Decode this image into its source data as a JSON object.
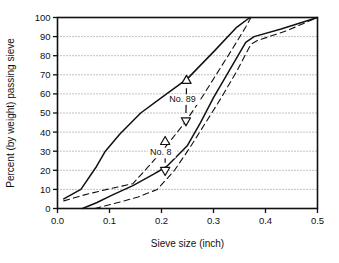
{
  "chart_data": {
    "type": "line",
    "title": "",
    "xlabel": "Sieve size (inch)",
    "ylabel": "Percent (by weight) passing sieve",
    "xlim": [
      0.0,
      0.5
    ],
    "ylim": [
      0,
      100
    ],
    "xticks": [
      "0.0",
      "0.1",
      "0.2",
      "0.3",
      "0.4",
      "0.5"
    ],
    "xtick_values": [
      0.0,
      0.1,
      0.2,
      0.3,
      0.4,
      0.5
    ],
    "yticks": [
      "0",
      "10",
      "20",
      "30",
      "40",
      "50",
      "60",
      "70",
      "80",
      "90",
      "100"
    ],
    "ytick_values": [
      0,
      10,
      20,
      30,
      40,
      50,
      60,
      70,
      80,
      90,
      100
    ],
    "grid": "horizontal-dotted",
    "legend": "none",
    "series": [
      {
        "name": "No. 89 upper limit (solid)",
        "style": "solid",
        "points": [
          [
            0.012,
            5
          ],
          [
            0.045,
            10
          ],
          [
            0.075,
            22
          ],
          [
            0.092,
            30
          ],
          [
            0.12,
            39
          ],
          [
            0.16,
            50
          ],
          [
            0.2,
            58
          ],
          [
            0.25,
            68
          ],
          [
            0.3,
            82
          ],
          [
            0.345,
            95
          ],
          [
            0.37,
            100
          ]
        ]
      },
      {
        "name": "No. 89 lower limit (solid)",
        "style": "solid",
        "points": [
          [
            0.048,
            0
          ],
          [
            0.075,
            3
          ],
          [
            0.105,
            7
          ],
          [
            0.145,
            12
          ],
          [
            0.185,
            18
          ],
          [
            0.21,
            22
          ],
          [
            0.25,
            33
          ],
          [
            0.275,
            45
          ],
          [
            0.3,
            58
          ],
          [
            0.33,
            72
          ],
          [
            0.362,
            87
          ],
          [
            0.378,
            90
          ],
          [
            0.43,
            94
          ],
          [
            0.5,
            100
          ]
        ]
      },
      {
        "name": "No. 8 upper limit (dashed)",
        "style": "dashed",
        "points": [
          [
            0.012,
            4
          ],
          [
            0.05,
            7
          ],
          [
            0.095,
            10
          ],
          [
            0.145,
            13
          ],
          [
            0.175,
            22
          ],
          [
            0.21,
            33
          ],
          [
            0.245,
            45
          ],
          [
            0.275,
            57
          ],
          [
            0.305,
            70
          ],
          [
            0.335,
            83
          ],
          [
            0.362,
            95
          ],
          [
            0.372,
            100
          ]
        ]
      },
      {
        "name": "No. 8 lower limit (dashed)",
        "style": "dashed",
        "points": [
          [
            0.072,
            0
          ],
          [
            0.115,
            3
          ],
          [
            0.155,
            6
          ],
          [
            0.192,
            10
          ],
          [
            0.225,
            20
          ],
          [
            0.255,
            32
          ],
          [
            0.285,
            45
          ],
          [
            0.315,
            58
          ],
          [
            0.345,
            72
          ],
          [
            0.372,
            86
          ],
          [
            0.385,
            88
          ],
          [
            0.44,
            93
          ],
          [
            0.5,
            100
          ]
        ]
      }
    ],
    "annotations": [
      {
        "label": "No. 89",
        "label_x": 0.215,
        "label_y": 56,
        "marker_up": {
          "x": 0.248,
          "y": 67
        },
        "marker_down": {
          "x": 0.247,
          "y": 46
        },
        "connector_from": {
          "x": 0.248,
          "y": 63
        },
        "connector_to": {
          "x": 0.247,
          "y": 50
        }
      },
      {
        "label": "No. 8",
        "label_x": 0.178,
        "label_y": 28,
        "marker_up": {
          "x": 0.207,
          "y": 35
        },
        "marker_down": {
          "x": 0.207,
          "y": 20
        },
        "connector_from": {
          "x": 0.207,
          "y": 32
        },
        "connector_to": {
          "x": 0.207,
          "y": 24
        }
      }
    ],
    "colors": {
      "line": "#111111",
      "grid": "#666666",
      "axis": "#111111",
      "background": "#ffffff"
    }
  }
}
